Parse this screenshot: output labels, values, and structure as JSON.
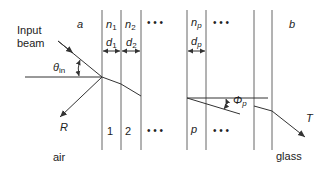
{
  "labels": {
    "input_beam_line1": "Input",
    "input_beam_line2": "beam",
    "medium_a": "a",
    "medium_b": "b",
    "theta_symbol": "θ",
    "theta_sub": "in",
    "reflected": "R",
    "transmitted": "T",
    "air": "air",
    "glass": "glass",
    "phi_symbol": "Φ",
    "phi_sub": "p"
  },
  "layers": [
    {
      "n_symbol": "n",
      "n_sub": "1",
      "d_symbol": "d",
      "d_sub": "1",
      "index": "1"
    },
    {
      "n_symbol": "n",
      "n_sub": "2",
      "d_symbol": "d",
      "d_sub": "2",
      "index": "2"
    },
    {
      "n_symbol": "n",
      "n_sub": "p",
      "d_symbol": "d",
      "d_sub": "p",
      "index": "p"
    }
  ],
  "ellipsis": "• • •",
  "colors": {
    "line": "#555555",
    "text": "#222222",
    "background": "#ffffff"
  }
}
